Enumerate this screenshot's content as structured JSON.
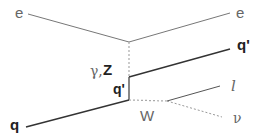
{
  "diagram": {
    "type": "feynman",
    "labels": {
      "e_in": "e",
      "e_out": "e",
      "boson_exchange": "γ,",
      "boson_exchange_z": "Z",
      "q_out": "q'",
      "q_internal": "q'",
      "q_in": "q",
      "w_boson": "W",
      "lepton": "l",
      "neutrino": "ν"
    },
    "colors": {
      "electron_line": "#777777",
      "quark_line": "#333333",
      "boson_line": "#aaaaaa",
      "lepton_line": "#555555"
    }
  }
}
